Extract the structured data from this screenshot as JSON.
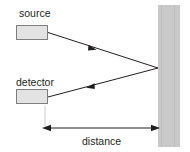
{
  "figure": {
    "background_color": "#ffffff"
  },
  "labels": {
    "source": "source",
    "detector": "detector",
    "distance": "distance"
  },
  "components": {
    "source_box": {
      "name": "source",
      "fill": "#e3e3e3",
      "stroke": "#7d7d7d",
      "x": 16,
      "y": 25,
      "width": 32,
      "height": 15
    },
    "detector_box": {
      "name": "detector",
      "fill": "#e3e3e3",
      "stroke": "#7d7d7d",
      "x": 16,
      "y": 89,
      "width": 32,
      "height": 15
    },
    "wall": {
      "name": "reflecting surface",
      "fill": "#c9c9c9",
      "x": 158,
      "y": 5,
      "width": 22,
      "height": 142
    }
  },
  "rays": {
    "outgoing": {
      "name": "source-to-wall ray",
      "from_x": 48,
      "from_y": 33,
      "to_x": 158,
      "to_y": 68,
      "arrow_at_x": 92,
      "arrow_at_y": 48,
      "color": "#231f20"
    },
    "returning": {
      "name": "wall-to-detector ray",
      "from_x": 158,
      "from_y": 68,
      "to_x": 48,
      "to_y": 97,
      "arrow_at_x": 90,
      "arrow_at_y": 88,
      "color": "#231f20"
    }
  },
  "dimension": {
    "label": "distance",
    "left_x": 45,
    "right_x": 158,
    "y": 128,
    "color": "#231f20",
    "extension_line_color": "#c9c9c9"
  },
  "colors": {
    "ink": "#231f20",
    "box_fill": "#e3e3e3",
    "box_stroke": "#7d7d7d",
    "wall_fill": "#c9c9c9",
    "background": "#ffffff"
  }
}
